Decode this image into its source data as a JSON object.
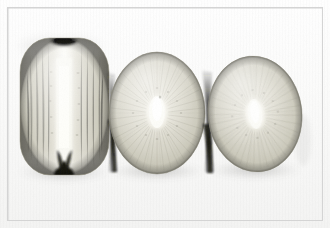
{
  "image": {
    "subject": "kiwifruit-sections",
    "description": "Three kiwifruit halves on a plain white background",
    "width": 330,
    "height": 228,
    "background_color": "#fbfbfb",
    "border_color": "#d8d8d8",
    "border_inset_px": 7,
    "flesh_color_light": "#e9e8e0",
    "flesh_color_mid": "#d6d4c7",
    "flesh_color_dark": "#b9b7a8",
    "core_color": "#fbfbf6",
    "ray_color": "#b0aea0",
    "shadow_color": "#2a2a28",
    "scar_color": "#1d1d1b"
  },
  "specimens": [
    {
      "label": "left-fruit",
      "cut": "longitudinal-section",
      "shape": "rounded-rectangle",
      "cx": 64,
      "cy": 106,
      "rx": 44,
      "ry": 68,
      "core_type": "column",
      "has_stem_scar": true,
      "has_blossom_scar": true,
      "ray_count": 0
    },
    {
      "label": "middle-fruit",
      "cut": "transverse-section",
      "shape": "ellipse",
      "cx": 157,
      "cy": 113,
      "rx": 48,
      "ry": 61,
      "core_type": "oval-pith",
      "has_stem_scar": false,
      "has_blossom_scar": false,
      "ray_count": 46
    },
    {
      "label": "right-fruit",
      "cut": "transverse-section",
      "shape": "ellipse",
      "cx": 255,
      "cy": 114,
      "rx": 47,
      "ry": 58,
      "core_type": "oval-pith",
      "has_stem_scar": false,
      "has_blossom_scar": false,
      "ray_count": 44
    }
  ],
  "shadows": [
    {
      "label": "gap-shadow-left",
      "x": 108,
      "y": 78,
      "w": 7,
      "h": 92
    },
    {
      "label": "gap-shadow-right",
      "x": 203,
      "y": 74,
      "w": 8,
      "h": 98
    }
  ]
}
